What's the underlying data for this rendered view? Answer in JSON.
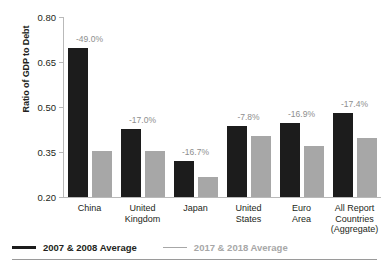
{
  "chart_data": {
    "type": "bar",
    "title": "",
    "subtitle": "",
    "xlabel": "",
    "ylabel": "Ratio of GDP to Debt",
    "ylim": [
      0.2,
      0.8
    ],
    "yticks": [
      "0.20",
      "0.35",
      "0.50",
      "0.65",
      "0.80"
    ],
    "ytick_values": [
      0.2,
      0.35,
      0.5,
      0.65,
      0.8
    ],
    "grid": false,
    "legend_position": "bottom-left",
    "categories": [
      "China",
      "United Kingdom",
      "Japan",
      "United States",
      "Euro Area",
      "All Report Countries (Aggregate)"
    ],
    "category_lines": [
      [
        "China"
      ],
      [
        "United",
        "Kingdom"
      ],
      [
        "Japan"
      ],
      [
        "United",
        "States"
      ],
      [
        "Euro",
        "Area"
      ],
      [
        "All Report",
        "Countries",
        "(Aggregate)"
      ]
    ],
    "series": [
      {
        "name": "2007 & 2008 Average",
        "color": "#1c1c1c",
        "values": [
          0.697,
          0.428,
          0.32,
          0.437,
          0.447,
          0.48
        ]
      },
      {
        "name": "2017 & 2018 Average",
        "color": "#a7a7a7",
        "values": [
          0.355,
          0.355,
          0.267,
          0.403,
          0.371,
          0.396
        ]
      }
    ],
    "annotations": [
      "-49.0%",
      "-17.0%",
      "-16.7%",
      "-7.8%",
      "-16.9%",
      "-17.4%"
    ],
    "annotation_color": "#8e8e8e"
  },
  "legend": {
    "items": [
      {
        "label": "2007 & 2008 Average",
        "color": "#1c1c1c"
      },
      {
        "label": "2017 & 2018 Average",
        "color": "#a7a7a7"
      }
    ]
  }
}
